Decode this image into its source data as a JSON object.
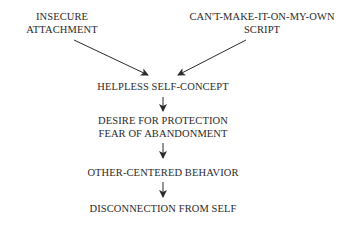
{
  "diagram": {
    "type": "flowchart",
    "nodes": {
      "insecure_attachment": {
        "line1": "INSECURE",
        "line2": "ATTACHMENT"
      },
      "script": {
        "line1": "CAN'T-MAKE-IT-ON-MY-OWN",
        "line2": "SCRIPT"
      },
      "helpless": {
        "label": "HELPLESS SELF-CONCEPT"
      },
      "desire": {
        "line1": "DESIRE FOR PROTECTION",
        "line2": "FEAR OF ABANDONMENT"
      },
      "other_centered": {
        "label": "OTHER-CENTERED BEHAVIOR"
      },
      "disconnection": {
        "label": "DISCONNECTION FROM SELF"
      }
    },
    "edges": [
      {
        "from": "insecure_attachment",
        "to": "helpless"
      },
      {
        "from": "script",
        "to": "helpless"
      },
      {
        "from": "helpless",
        "to": "desire"
      },
      {
        "from": "desire",
        "to": "other_centered"
      },
      {
        "from": "other_centered",
        "to": "disconnection"
      }
    ],
    "colors": {
      "text": "#2a2a2a",
      "arrow": "#2a2a2a",
      "background": "#ffffff"
    }
  }
}
